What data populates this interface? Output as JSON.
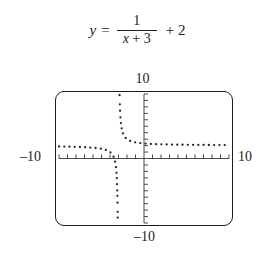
{
  "equation": {
    "lhs": "y",
    "equals": "=",
    "numerator": "1",
    "denominator_var": "x",
    "denominator_rest": "+ 3",
    "tail": "+ 2",
    "plain": "y = 1/(x + 3) + 2"
  },
  "graph": {
    "labels": {
      "ymax": "10",
      "ymin": "–10",
      "xmin": "–10",
      "xmax": "10"
    },
    "colors": {
      "frame": "#1d1d1d",
      "axis": "#4a4a4a",
      "curve": "#262626",
      "background": "#ffffff"
    }
  },
  "chart_data": {
    "type": "line",
    "xlabel": "x",
    "ylabel": "y",
    "xlim": [
      -10,
      10
    ],
    "ylim": [
      -10,
      10
    ],
    "xscl": 1,
    "yscl": 1,
    "grid": false,
    "legend": null,
    "style": "dotted",
    "function": "1/(x + 3) + 2",
    "asymptotes": {
      "vertical": -3,
      "horizontal": 2
    },
    "tick_labels": {
      "x": [
        "-10",
        "10"
      ],
      "y": [
        "-10",
        "10"
      ]
    },
    "series": [
      {
        "name": "left branch",
        "x": [
          -10.0,
          -9.4,
          -8.8,
          -8.2,
          -7.6,
          -7.0,
          -6.4,
          -5.8,
          -5.2,
          -4.6,
          -4.3,
          -4.0,
          -3.8,
          -3.6,
          -3.45,
          -3.33,
          -3.25,
          -3.18,
          -3.13,
          -3.09,
          -3.06,
          -3.04,
          -3.02
        ],
        "y": [
          1.857,
          1.844,
          1.828,
          1.808,
          1.783,
          1.75,
          1.706,
          1.643,
          1.545,
          1.375,
          1.231,
          1.0,
          0.75,
          0.333,
          -0.222,
          -1.03,
          -2.0,
          -3.56,
          -5.69,
          -9.11,
          -14.67,
          -23.0,
          -48.0
        ]
      },
      {
        "name": "right branch",
        "x": [
          -2.98,
          -2.96,
          -2.94,
          -2.91,
          -2.87,
          -2.82,
          -2.75,
          -2.67,
          -2.55,
          -2.4,
          -2.2,
          -2.0,
          -1.6,
          -1.2,
          -0.6,
          0.0,
          1.0,
          2.0,
          3.0,
          4.0,
          5.0,
          6.0,
          7.0,
          8.0,
          9.0,
          10.0
        ],
        "y": [
          52.0,
          27.0,
          18.67,
          13.11,
          9.69,
          7.56,
          6.0,
          5.03,
          4.22,
          3.67,
          3.25,
          3.0,
          2.714,
          2.556,
          2.417,
          2.333,
          2.25,
          2.2,
          2.167,
          2.143,
          2.125,
          2.111,
          2.1,
          2.091,
          2.083,
          2.077
        ]
      }
    ]
  }
}
